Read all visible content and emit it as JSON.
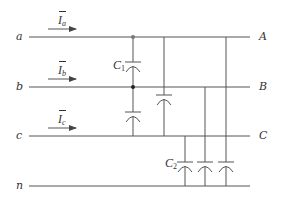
{
  "diagram": {
    "type": "three-phase line capacitance equivalent circuit",
    "stroke_color": "#555555",
    "input_nodes": [
      {
        "id": "a",
        "label": "a"
      },
      {
        "id": "b",
        "label": "b"
      },
      {
        "id": "c",
        "label": "c"
      },
      {
        "id": "n",
        "label": "n"
      }
    ],
    "output_nodes": [
      {
        "id": "A",
        "label": "A"
      },
      {
        "id": "B",
        "label": "B"
      },
      {
        "id": "C",
        "label": "C"
      }
    ],
    "currents": [
      {
        "symbol": "I",
        "subscript": "a",
        "direction": "right"
      },
      {
        "symbol": "I",
        "subscript": "b",
        "direction": "right"
      },
      {
        "symbol": "I",
        "subscript": "c",
        "direction": "right"
      }
    ],
    "capacitor_labels": [
      {
        "symbol": "C",
        "subscript": "1",
        "description": "line-to-line capacitance"
      },
      {
        "symbol": "C",
        "subscript": "2",
        "description": "line-to-neutral capacitance"
      }
    ],
    "capacitors": [
      {
        "from": "a",
        "to": "b",
        "group": "C1"
      },
      {
        "from": "b",
        "to": "c",
        "group": "C1"
      },
      {
        "from": "a",
        "to": "c",
        "group": "C1"
      },
      {
        "from": "c",
        "to": "n",
        "group": "C2"
      },
      {
        "from": "b",
        "to": "n",
        "group": "C2"
      },
      {
        "from": "a",
        "to": "n",
        "group": "C2"
      }
    ]
  }
}
